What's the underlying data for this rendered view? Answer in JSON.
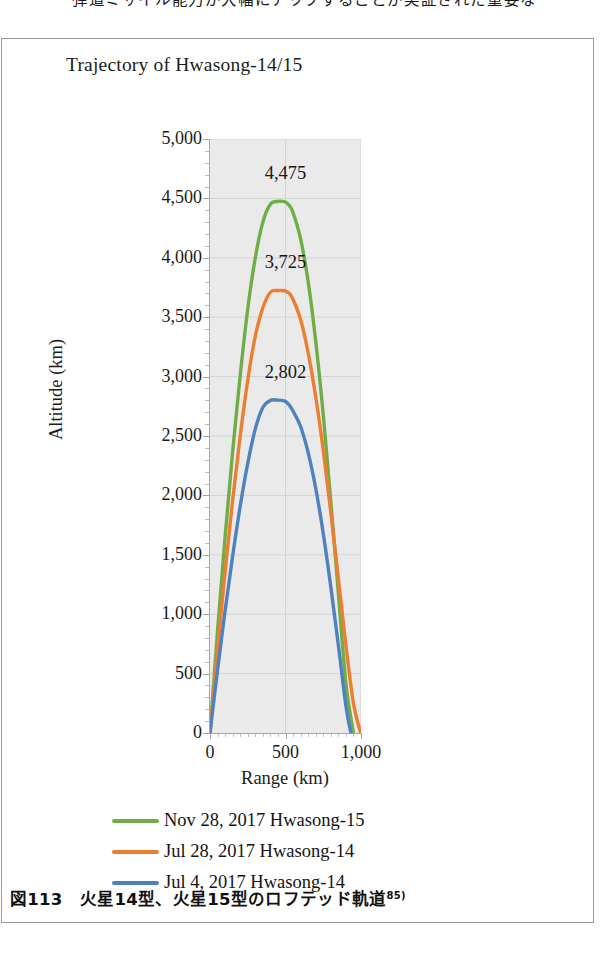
{
  "page": {
    "top_body_text": "弾道ミサイル能力が大幅にアップすることが実証された重要な",
    "caption_number": "図113",
    "caption_text": "火星14型、火星15型のロフテッド軌道",
    "caption_footnote": "85)"
  },
  "chart_data": {
    "type": "line",
    "title": "Trajectory of Hwasong-14/15",
    "xlabel": "Range (km)",
    "ylabel": "Altitude (km)",
    "xlim": [
      0,
      1000
    ],
    "ylim": [
      0,
      5000
    ],
    "xticks": [
      "0",
      "500",
      "1,000"
    ],
    "xtick_values": [
      0,
      500,
      1000
    ],
    "yticks": [
      "0",
      "500",
      "1,000",
      "1,500",
      "2,000",
      "2,500",
      "3,000",
      "3,500",
      "4,000",
      "4,500",
      "5,000"
    ],
    "ytick_values": [
      0,
      500,
      1000,
      1500,
      2000,
      2500,
      3000,
      3500,
      4000,
      4500,
      5000
    ],
    "grid": true,
    "legend_position": "bottom",
    "plot_background": "#eaeaea",
    "annotations": [
      {
        "label": "4,475",
        "x": 500,
        "y": 4475,
        "series": "Nov 28, 2017 Hwasong-15"
      },
      {
        "label": "3,725",
        "x": 500,
        "y": 3725,
        "series": "Jul 28, 2017 Hwasong-14"
      },
      {
        "label": "2,802",
        "x": 500,
        "y": 2802,
        "series": "Jul 4, 2017 Hwasong-14"
      }
    ],
    "series": [
      {
        "name": "Nov 28, 2017 Hwasong-15",
        "color": "#70AD47",
        "apogee": 4475,
        "range": 950,
        "x": [
          0,
          50,
          100,
          150,
          200,
          250,
          300,
          350,
          400,
          450,
          475,
          500,
          525,
          550,
          600,
          650,
          700,
          750,
          800,
          850,
          900,
          950
        ],
        "values": [
          0,
          860,
          1650,
          2370,
          3010,
          3570,
          4000,
          4300,
          4450,
          4475,
          4475,
          4470,
          4440,
          4380,
          4160,
          3800,
          3300,
          2680,
          1950,
          1180,
          420,
          0
        ]
      },
      {
        "name": "Jul 28, 2017 Hwasong-14",
        "color": "#ED7D31",
        "apogee": 3725,
        "range": 998,
        "x": [
          0,
          50,
          100,
          150,
          200,
          250,
          300,
          350,
          400,
          450,
          475,
          500,
          525,
          550,
          600,
          650,
          700,
          750,
          800,
          850,
          900,
          950,
          998
        ],
        "values": [
          0,
          700,
          1360,
          1960,
          2500,
          2970,
          3340,
          3580,
          3710,
          3725,
          3725,
          3720,
          3700,
          3650,
          3480,
          3200,
          2830,
          2380,
          1860,
          1300,
          740,
          250,
          0
        ]
      },
      {
        "name": "Jul 4, 2017 Hwasong-14",
        "color": "#4E81BD",
        "apogee": 2802,
        "range": 933,
        "x": [
          0,
          50,
          100,
          150,
          200,
          250,
          300,
          350,
          400,
          450,
          475,
          500,
          525,
          550,
          600,
          650,
          700,
          750,
          800,
          850,
          900,
          933
        ],
        "values": [
          0,
          530,
          1030,
          1490,
          1910,
          2270,
          2560,
          2740,
          2800,
          2802,
          2800,
          2790,
          2760,
          2710,
          2580,
          2360,
          2060,
          1680,
          1230,
          740,
          230,
          0
        ]
      }
    ]
  },
  "legend": {
    "items": [
      {
        "label": "Nov 28, 2017 Hwasong-15",
        "color": "#70AD47"
      },
      {
        "label": "Jul 28, 2017 Hwasong-14",
        "color": "#ED7D31"
      },
      {
        "label": "Jul 4, 2017 Hwasong-14",
        "color": "#4E81BD"
      }
    ]
  }
}
